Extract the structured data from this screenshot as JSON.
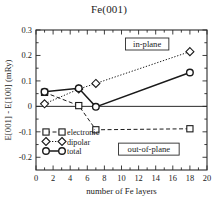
{
  "chart_data": {
    "type": "line",
    "title": "Fe(001)",
    "xlabel": "number of Fe layers",
    "ylabel": "E[001] - E[100]  (mRy)",
    "xlim": [
      0,
      20
    ],
    "ylim": [
      -0.25,
      0.3
    ],
    "x_ticks": [
      0,
      2,
      4,
      6,
      8,
      10,
      12,
      14,
      16,
      18,
      20
    ],
    "x_ticklabels": [
      "0",
      "2",
      "4",
      "6",
      "8",
      "10",
      "12",
      "14",
      "16",
      "18",
      "20"
    ],
    "y_ticks": [
      -0.2,
      -0.1,
      0,
      0.1,
      0.2,
      0.3
    ],
    "y_ticklabels": [
      "-0.2",
      "-0.1",
      "0",
      "0.1",
      "0.2",
      "0.3"
    ],
    "grid": false,
    "zero_line": true,
    "legend_position": "lower-left",
    "series": [
      {
        "name": "electronic",
        "marker": "square",
        "linestyle": "dashed",
        "x": [
          1,
          5,
          7,
          18
        ],
        "values": [
          0.055,
          0.003,
          -0.092,
          -0.088
        ]
      },
      {
        "name": "dipolar",
        "marker": "diamond",
        "linestyle": "dotted",
        "x": [
          1,
          5,
          7,
          18
        ],
        "values": [
          0.01,
          0.068,
          0.09,
          0.215
        ]
      },
      {
        "name": "total",
        "marker": "circle",
        "linestyle": "solid",
        "x": [
          1,
          5,
          7,
          18
        ],
        "values": [
          0.057,
          0.071,
          -0.002,
          0.133
        ]
      }
    ],
    "annotations": [
      {
        "text": "in-plane",
        "x": 13.0,
        "y": 0.245,
        "boxed": true
      },
      {
        "text": "out-of-plane",
        "x": 13.2,
        "y": -0.168,
        "boxed": true
      }
    ]
  }
}
